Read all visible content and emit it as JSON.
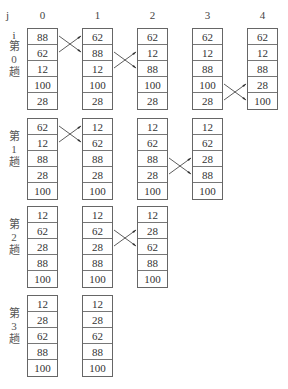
{
  "header": {
    "j_label": "j",
    "i_label": "i",
    "columns": [
      "0",
      "1",
      "2",
      "3",
      "4"
    ]
  },
  "passes": [
    {
      "label": [
        "第",
        "0",
        "趟"
      ],
      "columns": [
        [
          "88",
          "62",
          "12",
          "100",
          "28"
        ],
        [
          "62",
          "88",
          "12",
          "100",
          "28"
        ],
        [
          "62",
          "12",
          "88",
          "100",
          "28"
        ],
        [
          "62",
          "12",
          "88",
          "100",
          "28"
        ],
        [
          "62",
          "12",
          "88",
          "28",
          "100"
        ]
      ],
      "swaps": [
        {
          "from_col": 0,
          "to_col": 1,
          "rows": [
            0,
            1
          ]
        },
        {
          "from_col": 1,
          "to_col": 2,
          "rows": [
            1,
            2
          ]
        },
        {
          "from_col": 3,
          "to_col": 4,
          "rows": [
            3,
            4
          ]
        }
      ]
    },
    {
      "label": [
        "第",
        "1",
        "趟"
      ],
      "columns": [
        [
          "62",
          "12",
          "88",
          "28",
          "100"
        ],
        [
          "12",
          "62",
          "88",
          "28",
          "100"
        ],
        [
          "12",
          "62",
          "88",
          "28",
          "100"
        ],
        [
          "12",
          "62",
          "28",
          "88",
          "100"
        ]
      ],
      "swaps": [
        {
          "from_col": 0,
          "to_col": 1,
          "rows": [
            0,
            1
          ]
        },
        {
          "from_col": 2,
          "to_col": 3,
          "rows": [
            2,
            3
          ]
        }
      ]
    },
    {
      "label": [
        "第",
        "2",
        "趟"
      ],
      "columns": [
        [
          "12",
          "62",
          "28",
          "88",
          "100"
        ],
        [
          "12",
          "62",
          "28",
          "88",
          "100"
        ],
        [
          "12",
          "28",
          "62",
          "88",
          "100"
        ]
      ],
      "swaps": [
        {
          "from_col": 1,
          "to_col": 2,
          "rows": [
            1,
            2
          ]
        }
      ]
    },
    {
      "label": [
        "第",
        "3",
        "趟"
      ],
      "columns": [
        [
          "12",
          "28",
          "62",
          "88",
          "100"
        ],
        [
          "12",
          "28",
          "62",
          "88",
          "100"
        ]
      ],
      "swaps": []
    }
  ],
  "colors": {
    "border": "#666666",
    "text": "#333333",
    "arrow": "#333333"
  }
}
